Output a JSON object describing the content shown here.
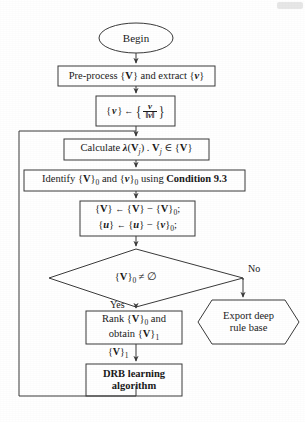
{
  "diagram": {
    "type": "flowchart",
    "stroke_color": "#3a3a3a",
    "text_color": "#1a1a1a",
    "background_color": "#ffffff"
  },
  "nodes": {
    "begin": {
      "shape": "ellipse",
      "label": "Begin"
    },
    "preprocess": {
      "shape": "process",
      "label_prefix": "Pre-process {",
      "label_v_bold": "V",
      "label_mid": "} and extract {",
      "label_v_italic": "v",
      "label_suffix": "}"
    },
    "normalize": {
      "shape": "process",
      "lhs": "{",
      "lhs_var": "v",
      "lhs_close": "}",
      "arrow": "←",
      "brace_open": "{",
      "numerator": "v",
      "denominator": "‖v‖",
      "brace_close": "}"
    },
    "calculate": {
      "shape": "process",
      "text_a": "Calculate ",
      "lambda": "λ",
      "text_b": "(",
      "v_bold": "V",
      "sub_j": "j",
      "text_c": ") . ",
      "v_bold2": "V",
      "sub_j2": "j",
      "member": " ∈ {",
      "v_bold3": "V",
      "text_d": "}"
    },
    "identify": {
      "shape": "process",
      "text_a": "Identify {",
      "v_bold": "V",
      "sub_0": "0",
      "text_b": " and {",
      "v_italic": "v",
      "sub_0b": "0",
      "text_c": " using ",
      "condition": "Condition 9.3"
    },
    "subtract": {
      "shape": "process",
      "line1": {
        "lhs_open": "{",
        "lhs_var": "V",
        "lhs_close": "}",
        "arrow": "←",
        "a_open": "{",
        "a_var": "V",
        "a_close": "}",
        "minus": "−",
        "b_open": "{",
        "b_var": "V",
        "b_close": "}",
        "b_sub": "0",
        "semi": ";"
      },
      "line2": {
        "lhs_open": "{",
        "lhs_var": "u",
        "lhs_close": "}",
        "arrow": "←",
        "a_open": "{",
        "a_var": "u",
        "a_close": "}",
        "minus": "−",
        "b_open": "{",
        "b_var": "v",
        "b_close": "}",
        "b_sub": "0",
        "semi": ";"
      }
    },
    "decision": {
      "shape": "diamond",
      "open": "{",
      "var": "V",
      "close": "}",
      "sub": "0",
      "condition": " ≠ ∅"
    },
    "export": {
      "shape": "hexagon",
      "line1": "Export deep",
      "line2": "rule base"
    },
    "rank": {
      "shape": "process",
      "line1_a": "Rank {",
      "line1_v": "V",
      "line1_b": "}",
      "line1_sub": "0",
      "line1_c": " and",
      "line2_a": "obtain {",
      "line2_v": "V",
      "line2_b": "}",
      "line2_sub": "1"
    },
    "drb": {
      "shape": "process",
      "line1": "DRB learning",
      "line2": "algorithm"
    }
  },
  "edge_labels": {
    "yes": "Yes",
    "no": "No",
    "v_one_open": "{",
    "v_one_var": "V",
    "v_one_close": "}",
    "v_one_sub": "1"
  }
}
